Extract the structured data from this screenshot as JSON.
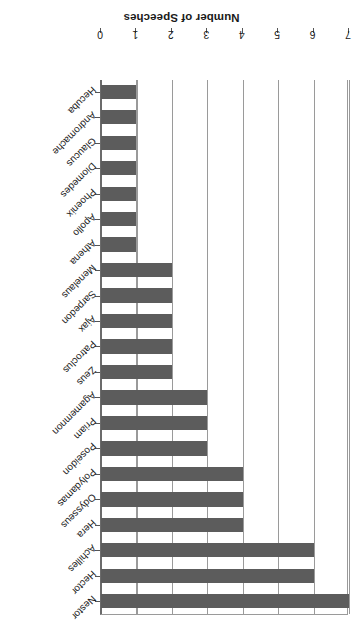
{
  "chart_data": {
    "type": "bar",
    "orientation": "horizontal",
    "title": "",
    "xlabel": "Number of Speeches",
    "ylabel": "",
    "xlim": [
      0,
      7
    ],
    "grid": true,
    "legend": false,
    "rotated_180": true,
    "bar_color": "#5c5c5c",
    "tick_labels": [
      "0",
      "1",
      "2",
      "3",
      "4",
      "5",
      "6",
      "7"
    ],
    "categories": [
      "Nestor",
      "Hector",
      "Achilles",
      "Hera",
      "Odysseus",
      "Polydamas",
      "Poseidon",
      "Priam",
      "Agamemnon",
      "Zeus",
      "Patroclus",
      "Ajax",
      "Sarpedon",
      "Menelaus",
      "Athena",
      "Apollo",
      "Phoenix",
      "Diomedes",
      "Glaucus",
      "Andromache",
      "Hecuba"
    ],
    "values": [
      7,
      6,
      6,
      4,
      4,
      4,
      3,
      3,
      3,
      2,
      2,
      2,
      2,
      2,
      1,
      1,
      1,
      1,
      1,
      1,
      1
    ]
  }
}
